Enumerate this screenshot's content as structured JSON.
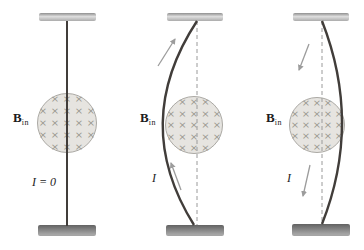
{
  "figure": {
    "field_pattern": {
      "symbol": "×",
      "rows": [
        3,
        5,
        5,
        5,
        3
      ]
    },
    "colors": {
      "wire": "#413d3a",
      "circle_fill": "#e6e4e0",
      "circle_border": "#aba9a4",
      "cross": "#97948d",
      "support_light": "#c7c7c7",
      "support_dark": "#8c8c8c",
      "arrow": "#9c9c9c",
      "dashed": "#9a9a9a",
      "label": "#1c1c1c"
    },
    "panels": [
      {
        "name": "no-current",
        "field_label": "B",
        "field_label_sub": "in",
        "current_label": "I = 0"
      },
      {
        "name": "current-up",
        "field_label": "B",
        "field_label_sub": "in",
        "current_label": "I"
      },
      {
        "name": "current-down",
        "field_label": "B",
        "field_label_sub": "in",
        "current_label": "I"
      }
    ]
  }
}
